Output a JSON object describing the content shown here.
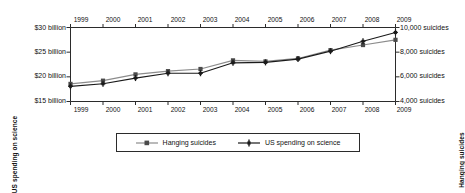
{
  "chart_data": {
    "type": "line",
    "title": "",
    "subtitle": "",
    "xlabel": "",
    "x": [
      1999,
      2000,
      2001,
      2002,
      2003,
      2004,
      2005,
      2006,
      2007,
      2008,
      2009
    ],
    "x_tick_labels": [
      "1999",
      "2000",
      "2001",
      "2002",
      "2003",
      "2004",
      "2005",
      "2006",
      "2007",
      "2008",
      "2009"
    ],
    "x_axis_top": true,
    "x_axis_bottom": true,
    "grid": false,
    "legend_position": "bottom-center",
    "axes": [
      {
        "id": "left",
        "title": "US spending on science",
        "tick_labels": [
          "$30 billion",
          "$25 billion",
          "$20 billion",
          "$15 billion"
        ],
        "tick_values": [
          30,
          25,
          20,
          15
        ],
        "ylim": [
          15,
          30
        ],
        "unit": "billion USD"
      },
      {
        "id": "right",
        "title": "Hanging suicides",
        "tick_labels": [
          "10,000 suicides",
          "8,000 suicides",
          "6,000 suicides",
          "4,000 suicides"
        ],
        "tick_values": [
          10000,
          8000,
          6000,
          4000
        ],
        "ylim": [
          4000,
          10000
        ],
        "unit": "suicides"
      }
    ],
    "series": [
      {
        "name": "Hanging suicides",
        "axis": "right",
        "color": "#8c8c8c",
        "marker": "square",
        "values": [
          5427,
          5688,
          6198,
          6462,
          6635,
          7336,
          7248,
          7491,
          8161,
          8578,
          9000
        ]
      },
      {
        "name": "US spending on science",
        "axis": "left",
        "color": "#1a1a1a",
        "marker": "plus",
        "values": [
          18.08,
          18.59,
          19.75,
          20.73,
          20.73,
          22.84,
          22.93,
          23.6,
          25.2,
          27.2,
          29.0
        ]
      }
    ]
  },
  "legend": {
    "entries": [
      {
        "label": "Hanging suicides",
        "color": "#8c8c8c"
      },
      {
        "label": "US spending on science",
        "color": "#1a1a1a"
      }
    ]
  },
  "colors": {
    "axis": "#2b2b2b",
    "text": "#111111",
    "background": "#ffffff",
    "series_gray": "#8c8c8c",
    "series_black": "#1a1a1a"
  }
}
